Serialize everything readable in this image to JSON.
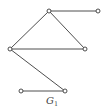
{
  "graph": {
    "label": "G",
    "label_subscript": "1",
    "nodes": [
      {
        "id": "top-center",
        "x": 49,
        "y": 11
      },
      {
        "id": "top-right",
        "x": 98,
        "y": 11
      },
      {
        "id": "left",
        "x": 10,
        "y": 49
      },
      {
        "id": "right-middle",
        "x": 85,
        "y": 49
      },
      {
        "id": "bottom-left",
        "x": 21,
        "y": 91
      },
      {
        "id": "bottom-right",
        "x": 65,
        "y": 91
      }
    ],
    "edges": [
      [
        "top-center",
        "top-right"
      ],
      [
        "top-center",
        "left"
      ],
      [
        "top-center",
        "right-middle"
      ],
      [
        "left",
        "right-middle"
      ],
      [
        "left",
        "bottom-right"
      ],
      [
        "bottom-left",
        "bottom-right"
      ]
    ]
  }
}
